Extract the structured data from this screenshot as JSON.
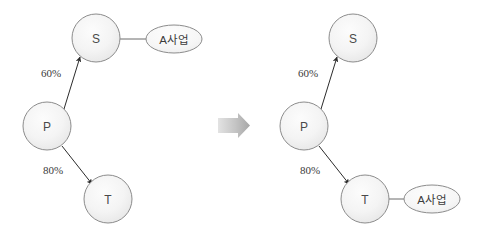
{
  "diagram": {
    "title": "",
    "background_color": "#ffffff",
    "node_fill": "#f2f2f2",
    "node_stroke": "#8c8c8c",
    "edge_color": "#333333",
    "transition_arrow_color": "#b0b0b0",
    "panels": [
      {
        "id": "before",
        "nodes": [
          {
            "id": "left-s",
            "label": "S",
            "cx": 96,
            "cy": 38,
            "r": 24
          },
          {
            "id": "left-p",
            "label": "P",
            "cx": 47,
            "cy": 126,
            "r": 24
          },
          {
            "id": "left-t",
            "label": "T",
            "cx": 108,
            "cy": 199,
            "r": 24
          }
        ],
        "ellipses": [
          {
            "id": "left-business",
            "label": "A사업",
            "cx": 174,
            "cy": 39,
            "rx": 28,
            "ry": 14
          }
        ],
        "edges": [
          {
            "id": "left-p-to-s",
            "from": "P",
            "to": "S",
            "weight": "60%",
            "label_x": 51,
            "label_y": 73,
            "x1": 64,
            "y1": 109,
            "x2": 80,
            "y2": 57
          },
          {
            "id": "left-p-to-t",
            "from": "P",
            "to": "T",
            "weight": "80%",
            "label_x": 53,
            "label_y": 170,
            "x1": 62,
            "y1": 146,
            "x2": 92,
            "y2": 184
          }
        ],
        "connectors": [
          {
            "id": "left-s-to-business",
            "from": "S",
            "to": "A사업",
            "x1": 120,
            "y1": 39,
            "x2": 146,
            "y2": 39
          }
        ]
      },
      {
        "id": "after",
        "nodes": [
          {
            "id": "right-s",
            "label": "S",
            "cx": 353,
            "cy": 38,
            "r": 24
          },
          {
            "id": "right-p",
            "label": "P",
            "cx": 304,
            "cy": 126,
            "r": 24
          },
          {
            "id": "right-t",
            "label": "T",
            "cx": 365,
            "cy": 199,
            "r": 24
          }
        ],
        "ellipses": [
          {
            "id": "right-business",
            "label": "A사업",
            "cx": 432,
            "cy": 199,
            "rx": 28,
            "ry": 14
          }
        ],
        "edges": [
          {
            "id": "right-p-to-s",
            "from": "P",
            "to": "S",
            "weight": "60%",
            "label_x": 308,
            "label_y": 73,
            "x1": 321,
            "y1": 109,
            "x2": 337,
            "y2": 57
          },
          {
            "id": "right-p-to-t",
            "from": "P",
            "to": "T",
            "weight": "80%",
            "label_x": 310,
            "label_y": 170,
            "x1": 319,
            "y1": 146,
            "x2": 349,
            "y2": 184
          }
        ],
        "connectors": [
          {
            "id": "right-t-to-business",
            "from": "T",
            "to": "A사업",
            "x1": 389,
            "y1": 199,
            "x2": 404,
            "y2": 199
          }
        ]
      }
    ],
    "transition": {
      "id": "transition-arrow",
      "direction": "right",
      "x": 218,
      "y": 113,
      "width": 32,
      "height": 25
    }
  }
}
